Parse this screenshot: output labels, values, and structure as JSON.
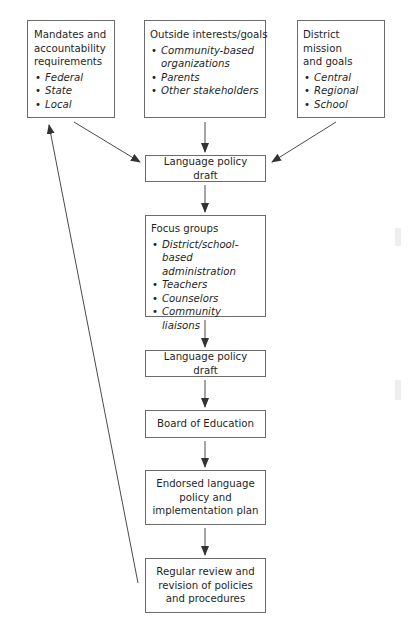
{
  "diagram": {
    "type": "flowchart",
    "inputs": [
      {
        "id": "mandates",
        "title": "Mandates and accountability requirements",
        "title_lines": [
          "Mandates and",
          "accountability",
          "requirements"
        ],
        "items": [
          "Federal",
          "State",
          "Local"
        ]
      },
      {
        "id": "outside",
        "title": "Outside interests/goals",
        "items": [
          "Community-based organizations",
          "Parents",
          "Other stakeholders"
        ]
      },
      {
        "id": "district",
        "title": "District mission and goals",
        "title_lines": [
          "District mission",
          "and goals"
        ],
        "items": [
          "Central",
          "Regional",
          "School"
        ]
      }
    ],
    "steps": [
      {
        "id": "draft1",
        "label": "Language policy draft"
      },
      {
        "id": "focus",
        "label": "Focus groups",
        "items": [
          "District/school-based administration",
          "Teachers",
          "Counselors",
          "Community liaisons"
        ]
      },
      {
        "id": "draft2",
        "label": "Language policy draft"
      },
      {
        "id": "board",
        "label": "Board of Education"
      },
      {
        "id": "endorsed",
        "label": "Endorsed language policy and implementation plan"
      },
      {
        "id": "review",
        "label": "Regular review and revision of policies and procedures"
      }
    ],
    "edges": [
      [
        "mandates",
        "draft1"
      ],
      [
        "outside",
        "draft1"
      ],
      [
        "district",
        "draft1"
      ],
      [
        "draft1",
        "focus"
      ],
      [
        "focus",
        "draft2"
      ],
      [
        "draft2",
        "board"
      ],
      [
        "board",
        "endorsed"
      ],
      [
        "endorsed",
        "review"
      ],
      [
        "review",
        "mandates"
      ]
    ],
    "colors": {
      "line": "#4a4a4a",
      "border": "#6b6b6b",
      "text": "#1f1f1f"
    }
  }
}
